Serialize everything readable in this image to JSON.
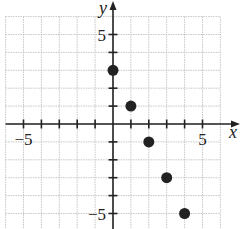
{
  "chart_data": {
    "type": "scatter",
    "title": "",
    "xlabel": "x",
    "ylabel": "y",
    "xlim": [
      -6,
      6
    ],
    "ylim": [
      -6,
      6
    ],
    "grid": true,
    "x_tick_labels": [
      {
        "value": -5,
        "label": "−5"
      },
      {
        "value": 5,
        "label": "5"
      }
    ],
    "y_tick_labels": [
      {
        "value": 5,
        "label": "5"
      },
      {
        "value": -5,
        "label": "−5"
      }
    ],
    "points": [
      {
        "x": 0,
        "y": 3
      },
      {
        "x": 1,
        "y": 1
      },
      {
        "x": 2,
        "y": -1
      },
      {
        "x": 3,
        "y": -3
      },
      {
        "x": 4,
        "y": -5
      }
    ]
  }
}
